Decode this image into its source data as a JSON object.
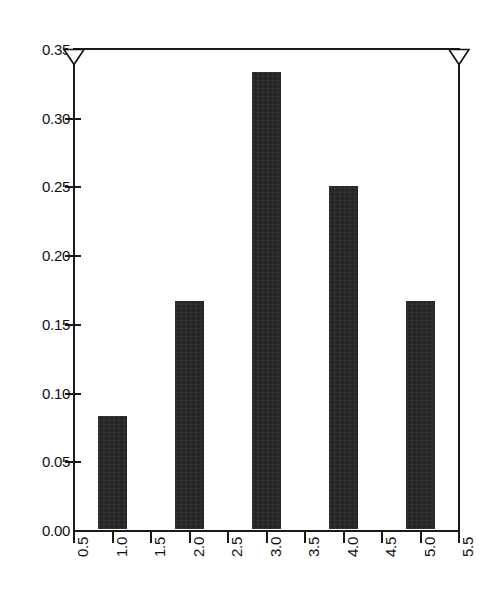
{
  "chart_data": {
    "type": "bar",
    "title": "",
    "subtitle": "",
    "xlabel": "",
    "ylabel": "",
    "categories": [
      "1.0",
      "2.0",
      "3.0",
      "4.0",
      "5.0"
    ],
    "x": [
      1,
      2,
      3,
      4,
      5
    ],
    "values": [
      0.0833,
      0.1667,
      0.3333,
      0.25,
      0.1667
    ],
    "series": [
      {
        "name": "frequency",
        "values": [
          0.0833,
          0.1667,
          0.3333,
          0.25,
          0.1667
        ]
      }
    ],
    "xlim": [
      0.5,
      5.5
    ],
    "ylim": [
      0.0,
      0.35
    ],
    "x_ticks": [
      "0.5",
      "1.0",
      "1.5",
      "2.0",
      "2.5",
      "3.0",
      "3.5",
      "4.0",
      "4.5",
      "5.0",
      "5.5"
    ],
    "x_tick_values": [
      0.5,
      1.0,
      1.5,
      2.0,
      2.5,
      3.0,
      3.5,
      4.0,
      4.5,
      5.0,
      5.5
    ],
    "y_ticks": [
      "0.00",
      "0.05",
      "0.10",
      "0.15",
      "0.20",
      "0.25",
      "0.30",
      "0.35"
    ],
    "y_tick_values": [
      0.0,
      0.05,
      0.1,
      0.15,
      0.2,
      0.25,
      0.3,
      0.35
    ],
    "grid": false,
    "legend": null,
    "legend_position": "none",
    "x_tick_rotation": 90,
    "bar_color": "#242424",
    "axis_color": "#1a1a1a",
    "background_color": "#ffffff",
    "bar_width_units": 0.38,
    "annotations": [
      {
        "name": "top-left-triangle",
        "shape": "triangle-down",
        "x": 0.5,
        "y": 0.35
      },
      {
        "name": "top-right-triangle",
        "shape": "triangle-down",
        "x": 5.5,
        "y": 0.35
      }
    ]
  }
}
